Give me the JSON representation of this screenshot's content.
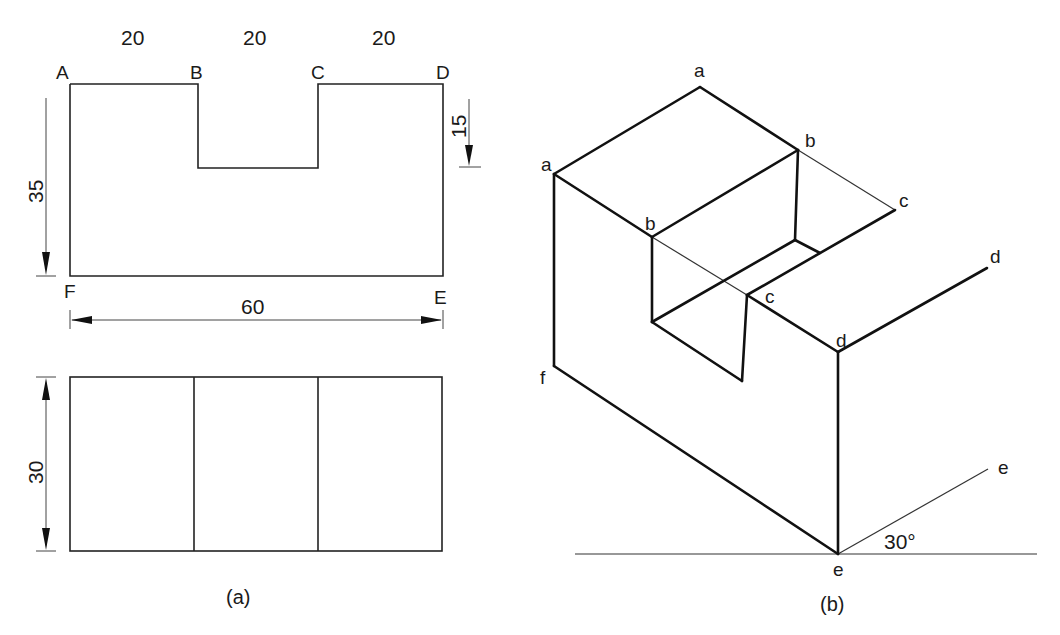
{
  "panel_a": {
    "caption": "(a)",
    "front_view": {
      "corner_labels": {
        "A": "A",
        "B": "B",
        "C": "C",
        "D": "D",
        "E": "E",
        "F": "F"
      },
      "dimensions": {
        "top_segment_1": "20",
        "top_segment_2": "20",
        "top_segment_3": "20",
        "height": "35",
        "slot_depth": "15",
        "width": "60"
      }
    },
    "top_view": {
      "dimensions": {
        "depth": "30"
      }
    }
  },
  "panel_b": {
    "caption": "(b)",
    "vertex_labels": {
      "a_top": "a",
      "a_left": "a",
      "b_right": "b",
      "b_left": "b",
      "c_right": "c",
      "c_front": "c",
      "d_right": "d",
      "d_front": "d",
      "e_right": "e",
      "e_bottom": "e",
      "f": "f"
    },
    "angle_label": "30°"
  }
}
